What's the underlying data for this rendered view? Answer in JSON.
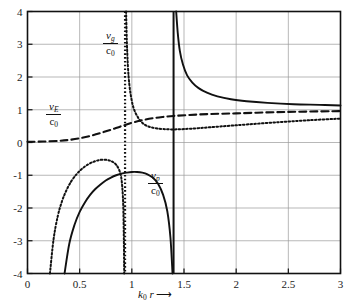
{
  "chart_data": {
    "type": "line",
    "title": "",
    "xlabel": "k_0 r",
    "ylabel": "",
    "xlim": [
      0,
      3
    ],
    "ylim": [
      -4,
      4
    ],
    "xticks": [
      "0",
      "0.5",
      "1",
      "1.5",
      "2",
      "2.5",
      "3"
    ],
    "xtick_values": [
      0,
      0.5,
      1,
      1.5,
      2,
      2.5,
      3
    ],
    "yticks": [
      "4",
      "3",
      "2",
      "1",
      "0",
      "-1",
      "-2",
      "-3",
      "-4"
    ],
    "ytick_values": [
      4,
      3,
      2,
      1,
      0,
      -1,
      -2,
      -3,
      -4
    ],
    "grid": true,
    "legend": "inline-annotations",
    "annotations": [
      {
        "id": "vg",
        "numerator": "v",
        "num_sub": "g",
        "denominator": "c",
        "den_sub": "0",
        "x_px": 103,
        "y_px": 30
      },
      {
        "id": "vE",
        "numerator": "v",
        "num_sub": "E",
        "denominator": "c",
        "den_sub": "0",
        "x_px": 46,
        "y_px": 101
      },
      {
        "id": "vp",
        "numerator": "v",
        "num_sub": "p",
        "denominator": "c",
        "den_sub": "0",
        "x_px": 148,
        "y_px": 170
      }
    ],
    "series": [
      {
        "name": "v_p/c_0",
        "style": "solid",
        "color": "#111111",
        "description": "phase velocity ratio; negative lobe below axis and hyperbolic branch decaying from +4 toward ~1",
        "asymptote_x": 1.4,
        "points_negative_lobe": [
          [
            0.355,
            -4.0
          ],
          [
            0.4,
            -3.1
          ],
          [
            0.45,
            -2.52
          ],
          [
            0.5,
            -2.12
          ],
          [
            0.55,
            -1.83
          ],
          [
            0.6,
            -1.6
          ],
          [
            0.65,
            -1.42
          ],
          [
            0.7,
            -1.28
          ],
          [
            0.75,
            -1.16
          ],
          [
            0.8,
            -1.07
          ],
          [
            0.85,
            -1.0
          ],
          [
            0.9,
            -0.95
          ],
          [
            0.95,
            -0.92
          ],
          [
            1.0,
            -0.9
          ],
          [
            1.05,
            -0.9
          ],
          [
            1.1,
            -0.92
          ],
          [
            1.15,
            -0.97
          ],
          [
            1.2,
            -1.07
          ],
          [
            1.25,
            -1.25
          ],
          [
            1.3,
            -1.6
          ],
          [
            1.34,
            -2.1
          ],
          [
            1.37,
            -2.9
          ],
          [
            1.39,
            -4.0
          ]
        ],
        "points_branch": [
          [
            1.425,
            4.0
          ],
          [
            1.44,
            3.35
          ],
          [
            1.46,
            2.8
          ],
          [
            1.49,
            2.38
          ],
          [
            1.53,
            2.05
          ],
          [
            1.58,
            1.83
          ],
          [
            1.64,
            1.66
          ],
          [
            1.72,
            1.52
          ],
          [
            1.82,
            1.41
          ],
          [
            1.95,
            1.32
          ],
          [
            2.1,
            1.26
          ],
          [
            2.3,
            1.21
          ],
          [
            2.55,
            1.17
          ],
          [
            2.8,
            1.15
          ],
          [
            3.0,
            1.13
          ]
        ]
      },
      {
        "name": "v_E/c_0",
        "style": "dashed",
        "color": "#111111",
        "description": "energy velocity ratio; rises monotonically from 0 toward ~1",
        "points": [
          [
            0.0,
            0.02
          ],
          [
            0.15,
            0.03
          ],
          [
            0.3,
            0.05
          ],
          [
            0.4,
            0.08
          ],
          [
            0.5,
            0.13
          ],
          [
            0.6,
            0.2
          ],
          [
            0.7,
            0.29
          ],
          [
            0.8,
            0.39
          ],
          [
            0.9,
            0.5
          ],
          [
            1.0,
            0.6
          ],
          [
            1.1,
            0.68
          ],
          [
            1.2,
            0.74
          ],
          [
            1.3,
            0.78
          ],
          [
            1.4,
            0.81
          ],
          [
            1.55,
            0.84
          ],
          [
            1.75,
            0.87
          ],
          [
            2.0,
            0.89
          ],
          [
            2.3,
            0.92
          ],
          [
            2.6,
            0.94
          ],
          [
            3.0,
            0.96
          ]
        ]
      },
      {
        "name": "v_g/c_0",
        "style": "dotted",
        "color": "#111111",
        "description": "group velocity ratio; negative lobe, vertical asymptote near k0r=0.93, falls from +4 to ~0.4 then rises",
        "asymptote_x": 0.93,
        "points_negative_lobe": [
          [
            0.215,
            -4.0
          ],
          [
            0.25,
            -2.95
          ],
          [
            0.29,
            -2.25
          ],
          [
            0.33,
            -1.8
          ],
          [
            0.37,
            -1.48
          ],
          [
            0.42,
            -1.18
          ],
          [
            0.47,
            -0.97
          ],
          [
            0.52,
            -0.81
          ],
          [
            0.58,
            -0.67
          ],
          [
            0.64,
            -0.58
          ],
          [
            0.7,
            -0.53
          ],
          [
            0.76,
            -0.53
          ],
          [
            0.81,
            -0.58
          ],
          [
            0.85,
            -0.68
          ],
          [
            0.88,
            -0.85
          ],
          [
            0.9,
            -1.1
          ],
          [
            0.915,
            -1.7
          ],
          [
            0.922,
            -2.6
          ],
          [
            0.927,
            -4.0
          ]
        ],
        "points_branch": [
          [
            0.945,
            4.0
          ],
          [
            0.952,
            3.1
          ],
          [
            0.962,
            2.35
          ],
          [
            0.975,
            1.8
          ],
          [
            0.995,
            1.35
          ],
          [
            1.02,
            1.02
          ],
          [
            1.06,
            0.76
          ],
          [
            1.1,
            0.6
          ],
          [
            1.15,
            0.5
          ],
          [
            1.22,
            0.44
          ],
          [
            1.3,
            0.41
          ],
          [
            1.4,
            0.4
          ],
          [
            1.5,
            0.41
          ],
          [
            1.65,
            0.44
          ],
          [
            1.85,
            0.49
          ],
          [
            2.1,
            0.55
          ],
          [
            2.4,
            0.62
          ],
          [
            2.7,
            0.68
          ],
          [
            3.0,
            0.73
          ]
        ]
      },
      {
        "name": "resonance-line",
        "style": "solid-vertical",
        "color": "#111111",
        "description": "vertical solid line marking cutoff",
        "x": 1.4
      },
      {
        "name": "asymptote-line",
        "style": "dotted-vertical",
        "color": "#111111",
        "description": "vertical dotted line marking group-velocity pole",
        "x": 0.935
      }
    ]
  },
  "axis": {
    "x_caption_symbol": "k",
    "x_caption_sub": "0",
    "x_caption_var": "r",
    "arrow": "⟶"
  }
}
